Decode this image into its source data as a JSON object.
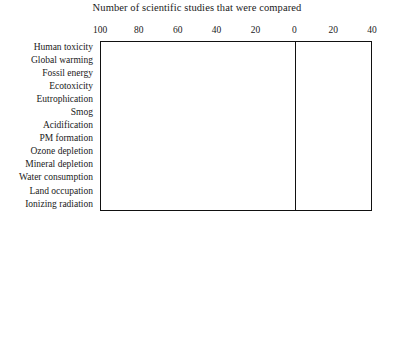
{
  "chart_data": {
    "type": "bar",
    "subtype": "stacked-diverging-horizontal",
    "title": "Number of scientific studies that were compared",
    "xlabel": "",
    "ylabel": "",
    "xlim": [
      -100,
      40
    ],
    "xticks": [
      -100,
      -80,
      -60,
      -40,
      -20,
      0,
      20,
      40
    ],
    "xtick_labels": [
      "100",
      "80",
      "60",
      "40",
      "20",
      "0",
      "20",
      "40"
    ],
    "grid": false,
    "legend_position": "bottom",
    "axis_note": "Left side of zero counts studies finding lower impact; right side counts studies finding higher impact. Tick labels are unsigned magnitudes.",
    "categories": [
      "Human toxicity",
      "Global warming",
      "Fossil energy",
      "Ecotoxicity",
      "Eutrophication",
      "Smog",
      "Acidification",
      "PM formation",
      "Ozone depletion",
      "Mineral depletion",
      "Water consumption",
      "Land occupation",
      "Ionizing radiation"
    ],
    "series": [
      {
        "name": "<0.75 = meaningfully lower life cycle impact",
        "key": "meaningfully_lower",
        "color": "#ffffff"
      },
      {
        "name": ">-0.75 and <1 = marginally lower life cycle impact",
        "key": "marginally_lower",
        "color": "#3d3d3d"
      },
      {
        "name": ">1 and <-1.25 = marginally higher life cycle impact",
        "key": "marginally_higher",
        "color": "#b3b3b3"
      },
      {
        "name": ">1.25 = meaningfully higher life cycle impact",
        "key": "meaningfully_higher",
        "color": "#1a1a1a"
      }
    ],
    "rows": [
      {
        "category": "Human toxicity",
        "left": [
          {
            "k": "marginally_higher",
            "v": 3
          },
          {
            "k": "marginally_lower",
            "v": 20
          }
        ],
        "right": [
          {
            "k": "meaningfully_lower",
            "v": 14
          }
        ],
        "net": -9
      },
      {
        "category": "Global warming",
        "left": [
          {
            "k": "marginally_higher",
            "v": 7
          },
          {
            "k": "marginally_lower",
            "v": 82
          }
        ],
        "right": [
          {
            "k": "meaningfully_lower",
            "v": 14
          },
          {
            "k": "marginally_higher",
            "v": 3
          }
        ],
        "net": -61
      },
      {
        "category": "Fossil energy",
        "left": [
          {
            "k": "marginally_higher",
            "v": 4
          },
          {
            "k": "marginally_lower",
            "v": 70
          }
        ],
        "right": [
          {
            "k": "meaningfully_lower",
            "v": 12
          },
          {
            "k": "marginally_higher",
            "v": 6
          }
        ],
        "net": -58
      },
      {
        "category": "Ecotoxicity",
        "left": [
          {
            "k": "marginally_higher",
            "v": 9
          },
          {
            "k": "marginally_lower",
            "v": 50
          }
        ],
        "right": [
          {
            "k": "meaningfully_lower",
            "v": 18
          },
          {
            "k": "meaningfully_higher",
            "v": 2
          }
        ],
        "net": -40
      },
      {
        "category": "Eutrophication",
        "left": [
          {
            "k": "marginally_higher",
            "v": 11
          },
          {
            "k": "marginally_lower",
            "v": 30
          }
        ],
        "right": [
          {
            "k": "meaningfully_lower",
            "v": 6
          },
          {
            "k": "marginally_higher",
            "v": 11
          }
        ],
        "net": -29
      },
      {
        "category": "Smog",
        "left": [
          {
            "k": "marginally_higher",
            "v": 5
          },
          {
            "k": "marginally_lower",
            "v": 19
          }
        ],
        "right": [
          {
            "k": "meaningfully_lower",
            "v": 3
          },
          {
            "k": "meaningfully_higher",
            "v": 3
          }
        ],
        "net": -15
      },
      {
        "category": "Acidification",
        "left": [
          {
            "k": "marginally_higher",
            "v": 6
          },
          {
            "k": "marginally_lower",
            "v": 26
          }
        ],
        "right": [
          {
            "k": "meaningfully_lower",
            "v": 10
          },
          {
            "k": "meaningfully_higher",
            "v": 2
          }
        ],
        "net": -20
      },
      {
        "category": "PM formation",
        "left": [
          {
            "k": "marginally_lower",
            "v": 14
          }
        ],
        "right": [
          {
            "k": "meaningfully_higher",
            "v": 3
          }
        ],
        "net": -10
      },
      {
        "category": "Ozone depletion",
        "left": [
          {
            "k": "marginally_higher",
            "v": 3
          },
          {
            "k": "marginally_lower",
            "v": 15
          }
        ],
        "right": [
          {
            "k": "meaningfully_lower",
            "v": 6
          },
          {
            "k": "marginally_higher",
            "v": 5
          }
        ],
        "net": -11
      },
      {
        "category": "Mineral depletion",
        "left": [
          {
            "k": "marginally_lower",
            "v": 15
          }
        ],
        "right": [
          {
            "k": "meaningfully_lower",
            "v": 10
          },
          {
            "k": "marginally_higher",
            "v": 3
          }
        ],
        "net": -8
      },
      {
        "category": "Water consumption",
        "left": [
          {
            "k": "marginally_higher",
            "v": 9
          }
        ],
        "right": [
          {
            "k": "marginally_higher",
            "v": 9
          }
        ],
        "net": 3
      },
      {
        "category": "Land occupation",
        "left": [
          {
            "k": "marginally_higher",
            "v": 3
          }
        ],
        "right": [],
        "net": -1
      },
      {
        "category": "Ionizing radiation",
        "left": [
          {
            "k": "marginally_higher",
            "v": 4
          }
        ],
        "right": [
          {
            "k": "meaningfully_lower",
            "v": 3
          }
        ],
        "net": -1
      }
    ]
  },
  "legend": {
    "items": [
      {
        "swatch": "white",
        "label": "<0.75 = meaningfully lower life cycle impact"
      },
      {
        "swatch": "dark-gray",
        "label": ">-0.75 and <1 = marginally lower life cycle impact"
      },
      {
        "swatch": "light-gray",
        "label": ">1 and <−1.25 = marginally higher life cycle impact"
      },
      {
        "swatch": "black",
        "label": ">1.25 = meaningfully higher life cycle impact"
      },
      {
        "swatch": "diamond",
        "label": "Net result"
      }
    ]
  },
  "colors": {
    "meaningfully_lower": "#ffffff",
    "marginally_lower": "#3d3d3d",
    "marginally_higher": "#b3b3b3",
    "meaningfully_higher": "#1a1a1a",
    "axis": "#111111",
    "text": "#1a1a1a"
  }
}
